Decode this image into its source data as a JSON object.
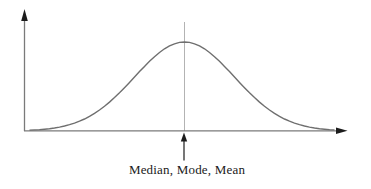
{
  "diagram": {
    "type": "normal-distribution-curve",
    "annotation": {
      "label": "Median, Mode, Mean"
    }
  },
  "colors": {
    "background": "#ffffff",
    "curve": "#6f6f6f",
    "axis": "#7a7a7a",
    "arrowhead": "#1c1c1c",
    "center_line": "#b3b3b3",
    "pointer_arrow": "#1c1c1c",
    "label_text": "#1a1a1a"
  }
}
